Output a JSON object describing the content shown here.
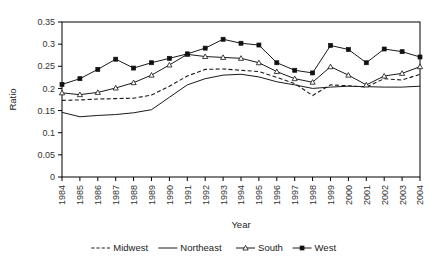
{
  "chart_data": {
    "type": "line",
    "title": "",
    "xlabel": "Year",
    "ylabel": "Ratio",
    "grid": false,
    "legend_position": "bottom",
    "ylim": [
      0,
      0.35
    ],
    "ytick_labels": [
      "0",
      "0.05",
      "0.1",
      "0.15",
      "0.2",
      "0.25",
      "0.3",
      "0.35"
    ],
    "ytick_values": [
      0,
      0.05,
      0.1,
      0.15,
      0.2,
      0.25,
      0.3,
      0.35
    ],
    "categories": [
      "1984",
      "1985",
      "1986",
      "1987",
      "1988",
      "1989",
      "1990",
      "1991",
      "1992",
      "1993",
      "1994",
      "1995",
      "1996",
      "1997",
      "1998",
      "1999",
      "2000",
      "2001",
      "2002",
      "2003",
      "2004"
    ],
    "series": [
      {
        "name": "Midwest",
        "style": "dashed",
        "marker": "none",
        "values": [
          0.173,
          0.174,
          0.176,
          0.177,
          0.178,
          0.185,
          0.205,
          0.228,
          0.243,
          0.244,
          0.241,
          0.238,
          0.225,
          0.211,
          0.184,
          0.208,
          0.206,
          0.203,
          0.222,
          0.219,
          0.232
        ]
      },
      {
        "name": "Northeast",
        "style": "solid",
        "marker": "none",
        "values": [
          0.146,
          0.136,
          0.139,
          0.141,
          0.145,
          0.152,
          0.18,
          0.208,
          0.222,
          0.23,
          0.232,
          0.226,
          0.215,
          0.208,
          0.2,
          0.203,
          0.205,
          0.204,
          0.203,
          0.203,
          0.205
        ]
      },
      {
        "name": "South",
        "style": "solid",
        "marker": "triangle",
        "values": [
          0.19,
          0.186,
          0.191,
          0.201,
          0.213,
          0.23,
          0.253,
          0.277,
          0.272,
          0.27,
          0.268,
          0.258,
          0.238,
          0.222,
          0.214,
          0.249,
          0.23,
          0.208,
          0.228,
          0.234,
          0.249
        ]
      },
      {
        "name": "West",
        "style": "solid",
        "marker": "square",
        "values": [
          0.209,
          0.222,
          0.243,
          0.266,
          0.246,
          0.258,
          0.268,
          0.278,
          0.291,
          0.311,
          0.302,
          0.298,
          0.258,
          0.241,
          0.235,
          0.297,
          0.288,
          0.258,
          0.289,
          0.283,
          0.271
        ]
      }
    ]
  },
  "legend": {
    "items": [
      {
        "label": "Midwest"
      },
      {
        "label": "Northeast"
      },
      {
        "label": "South"
      },
      {
        "label": "West"
      }
    ]
  }
}
